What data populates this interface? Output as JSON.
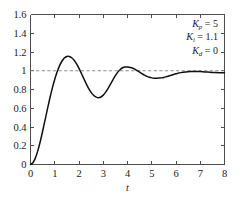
{
  "chart_data": {
    "type": "line",
    "title": "",
    "xlabel": "t",
    "ylabel": "",
    "xlim": [
      0,
      8
    ],
    "ylim": [
      0,
      1.6
    ],
    "grid": false,
    "legend": "none",
    "xticks": [
      "0",
      "1",
      "2",
      "3",
      "4",
      "5",
      "6",
      "7",
      "8"
    ],
    "yticks": [
      "0",
      "0.2",
      "0.4",
      "0.6",
      "0.8",
      "1",
      "1.2",
      "1.4",
      "1.6"
    ],
    "xtick_values": [
      0,
      1,
      2,
      3,
      4,
      5,
      6,
      7,
      8
    ],
    "ytick_values": [
      0,
      0.2,
      0.4,
      0.6,
      0.8,
      1,
      1.2,
      1.4,
      1.6
    ],
    "series": [
      {
        "name": "step-response",
        "style": "solid",
        "color": "#111111",
        "x": [
          0,
          0.1,
          0.2,
          0.3,
          0.4,
          0.5,
          0.6,
          0.7,
          0.8,
          0.9,
          1.0,
          1.1,
          1.2,
          1.3,
          1.35,
          1.4,
          1.5,
          1.6,
          1.7,
          1.8,
          1.9,
          2.0,
          2.1,
          2.2,
          2.3,
          2.4,
          2.5,
          2.6,
          2.65,
          2.7,
          2.8,
          2.9,
          3.0,
          3.1,
          3.2,
          3.3,
          3.4,
          3.5,
          3.6,
          3.7,
          3.8,
          3.9,
          4.0,
          4.05,
          4.1,
          4.2,
          4.3,
          4.4,
          4.5,
          4.6,
          4.7,
          4.8,
          4.9,
          5.0,
          5.1,
          5.2,
          5.3,
          5.4,
          5.5,
          5.6,
          5.7,
          5.8,
          5.9,
          6.0,
          6.2,
          6.4,
          6.6,
          6.8,
          7.0,
          7.2,
          7.4,
          7.6,
          7.8,
          8.0
        ],
        "y": [
          0,
          0.018,
          0.068,
          0.145,
          0.243,
          0.355,
          0.474,
          0.594,
          0.709,
          0.815,
          0.909,
          0.989,
          1.055,
          1.104,
          1.12,
          1.137,
          1.153,
          1.153,
          1.139,
          1.112,
          1.073,
          1.025,
          0.971,
          0.915,
          0.86,
          0.81,
          0.769,
          0.738,
          0.728,
          0.72,
          0.713,
          0.72,
          0.74,
          0.772,
          0.812,
          0.857,
          0.903,
          0.947,
          0.985,
          1.014,
          1.032,
          1.04,
          1.039,
          1.038,
          1.035,
          1.029,
          1.017,
          1.002,
          0.986,
          0.969,
          0.953,
          0.94,
          0.93,
          0.924,
          0.921,
          0.921,
          0.922,
          0.924,
          0.929,
          0.936,
          0.944,
          0.952,
          0.96,
          0.967,
          0.98,
          0.988,
          0.992,
          0.993,
          0.991,
          0.988,
          0.984,
          0.981,
          0.979,
          0.978
        ],
        "peaks": [
          {
            "label": "first-overshoot",
            "t": 1.35,
            "value": 1.31
          },
          {
            "label": "first-undershoot",
            "t": 2.65,
            "value": 0.72
          },
          {
            "label": "second-overshoot",
            "t": 4.05,
            "value": 1.04
          },
          {
            "label": "second-undershoot",
            "t": 5.4,
            "value": 0.92
          }
        ]
      }
    ],
    "reference_line": {
      "name": "setpoint",
      "orientation": "horizontal",
      "value": 1,
      "style": "dashed",
      "color": "#8c8c8c"
    },
    "annotations": [
      {
        "symbol": "K",
        "subscript": "p",
        "equals": "=",
        "value": "5"
      },
      {
        "symbol": "K",
        "subscript": "i",
        "equals": "=",
        "value": "1.1"
      },
      {
        "symbol": "K",
        "subscript": "d",
        "equals": "=",
        "value": "0"
      }
    ]
  }
}
